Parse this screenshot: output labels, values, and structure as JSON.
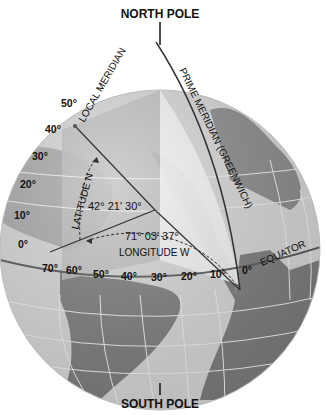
{
  "diagram": {
    "title_top": "NORTH POLE",
    "title_bottom": "SOUTH POLE",
    "local_meridian_label": "LOCAL MERIDIAN",
    "prime_meridian_label": "PRIME MERIDIAN (GREENWICH)",
    "equator_label": "EQUATOR",
    "latitude_label": "LATITUDE N",
    "longitude_label": "LONGITUDE W",
    "latitude_value": "42° 21' 30°",
    "longitude_value": "71° 03' 37°",
    "latitude_ticks": [
      "50°",
      "40°",
      "30°",
      "20°",
      "10°",
      "0°"
    ],
    "longitude_ticks": [
      "70°",
      "60°",
      "50°",
      "40°",
      "30°",
      "20°",
      "10°",
      "0°"
    ],
    "colors": {
      "ocean": "#d9d9d9",
      "land": "#7a7a7a",
      "highlight_wedge": "#bdbdbd",
      "light_panel": "#f2f2f2",
      "grid": "#eeeeee",
      "line": "#333333"
    }
  }
}
